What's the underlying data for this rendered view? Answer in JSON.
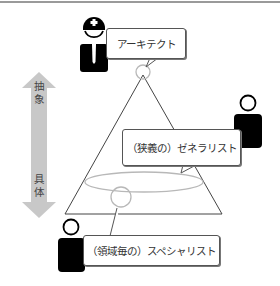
{
  "diagram": {
    "axis": {
      "top_label_chars": [
        "抽",
        "象"
      ],
      "bottom_label_chars": [
        "具",
        "体"
      ],
      "arrow_color": "#c8c8c8"
    },
    "roles": {
      "architect": {
        "label": "アーキテクト"
      },
      "generalist": {
        "label": "（狭義の）ゼネラリスト"
      },
      "specialist": {
        "label": "（領域毎の）スペシャリスト"
      }
    },
    "colors": {
      "triangle_stroke": "#444444",
      "highlight_stroke": "#b8b8b8",
      "person_fill": "#000000",
      "top_line": "#9a9a9a"
    }
  }
}
